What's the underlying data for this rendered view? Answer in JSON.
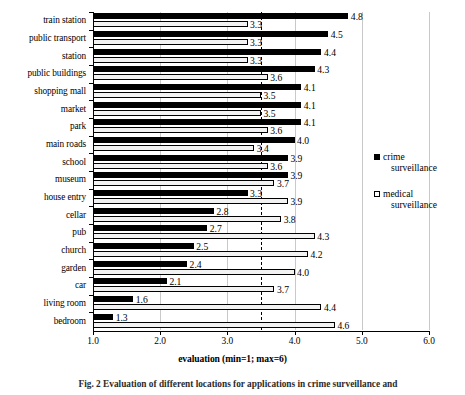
{
  "chart_data": {
    "type": "bar",
    "orientation": "horizontal",
    "title": "",
    "xlabel": "evaluation (min=1; max=6)",
    "ylabel": "",
    "xlim": [
      1.0,
      6.0
    ],
    "xticks": [
      "1.0",
      "2.0",
      "3.0",
      "4.0",
      "5.0",
      "6.0"
    ],
    "grid": true,
    "reference_line": 3.5,
    "legend_position": "right",
    "categories": [
      "train station",
      "public transport",
      "station",
      "public buildings",
      "shopping mall",
      "market",
      "park",
      "main roads",
      "school",
      "museum",
      "house entry",
      "cellar",
      "pub",
      "church",
      "garden",
      "car",
      "living room",
      "bedroom"
    ],
    "series": [
      {
        "name": "crime surveillance",
        "color": "#000000",
        "values": [
          4.8,
          4.5,
          4.4,
          4.3,
          4.1,
          4.1,
          4.1,
          4.0,
          3.9,
          3.9,
          3.3,
          2.8,
          2.7,
          2.5,
          2.4,
          2.1,
          1.6,
          1.3
        ]
      },
      {
        "name": "medical surveillance",
        "color": "#f2f2f2",
        "values": [
          3.3,
          3.3,
          3.3,
          3.6,
          3.5,
          3.5,
          3.6,
          3.4,
          3.6,
          3.7,
          3.9,
          3.8,
          4.3,
          4.2,
          4.0,
          3.7,
          4.4,
          4.6
        ]
      }
    ]
  },
  "legend": {
    "entries": [
      {
        "line1": "crime",
        "line2": "surveillance"
      },
      {
        "line1": "medical",
        "line2": "surveillance"
      }
    ]
  },
  "caption": {
    "text": "Fig. 2   Evaluation of different locations for applications in crime surveillance and"
  }
}
